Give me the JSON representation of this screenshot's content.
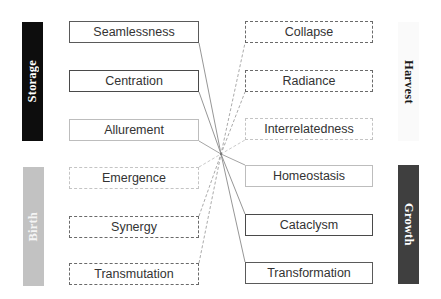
{
  "diagram": {
    "type": "bipartite-crossing-map",
    "crossing_point": [
      221,
      154
    ],
    "colors": {
      "storage_bar": "#0d0d0d",
      "birth_bar": "#c2c2c2",
      "harvest_bar": "#fafafa",
      "growth_bar": "#3f3f3f",
      "solid_line": "#8a8a8a",
      "dashed_line": "#a8a8a8",
      "box_text": "#333333"
    },
    "side_labels": {
      "storage": "Storage",
      "birth": "Birth",
      "harvest": "Harvest",
      "growth": "Growth"
    },
    "left_boxes": [
      {
        "label": "Seamlessness",
        "style": "solid-dark"
      },
      {
        "label": "Centration",
        "style": "solid-darker"
      },
      {
        "label": "Allurement",
        "style": "solid-light"
      },
      {
        "label": "Emergence",
        "style": "dash-light"
      },
      {
        "label": "Synergy",
        "style": "dash-dark"
      },
      {
        "label": "Transmutation",
        "style": "dash-dark"
      }
    ],
    "right_boxes": [
      {
        "label": "Collapse",
        "style": "dash-dark"
      },
      {
        "label": "Radiance",
        "style": "dash-dark"
      },
      {
        "label": "Interrelatedness",
        "style": "dash-light"
      },
      {
        "label": "Homeostasis",
        "style": "solid-light"
      },
      {
        "label": "Cataclysm",
        "style": "solid-darker"
      },
      {
        "label": "Transformation",
        "style": "solid-dark"
      }
    ],
    "links": [
      {
        "from": "Seamlessness",
        "to": "Transformation",
        "line": "solid"
      },
      {
        "from": "Centration",
        "to": "Cataclysm",
        "line": "solid"
      },
      {
        "from": "Allurement",
        "to": "Homeostasis",
        "line": "solid"
      },
      {
        "from": "Emergence",
        "to": "Interrelatedness",
        "line": "dashed"
      },
      {
        "from": "Synergy",
        "to": "Radiance",
        "line": "dashed"
      },
      {
        "from": "Transmutation",
        "to": "Collapse",
        "line": "dashed"
      }
    ]
  }
}
